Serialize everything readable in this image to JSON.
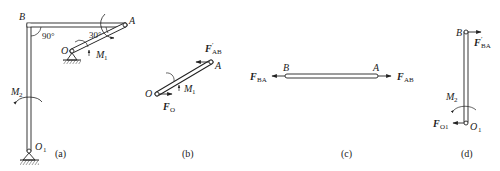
{
  "figure": {
    "panels": [
      {
        "id": "a",
        "caption": "(a)",
        "labels": {
          "B": "B",
          "A": "A",
          "O": "O",
          "O1": "O",
          "O1_sub": "1",
          "angle_90": "90°",
          "angle_30": "30°",
          "M1": "M",
          "M1_sub": "1",
          "M2": "M",
          "M2_sub": "2"
        }
      },
      {
        "id": "b",
        "caption": "(b)",
        "labels": {
          "O": "O",
          "A": "A",
          "FAB_prime": "F",
          "FAB_prime_sup": "′",
          "FAB_prime_sub": "AB",
          "M1": "M",
          "M1_sub": "1",
          "FO": "F",
          "FO_sub": "O"
        }
      },
      {
        "id": "c",
        "caption": "(c)",
        "labels": {
          "B": "B",
          "A": "A",
          "FBA": "F",
          "FBA_sub": "BA",
          "FAB": "F",
          "FAB_sub": "AB"
        }
      },
      {
        "id": "d",
        "caption": "(d)",
        "labels": {
          "B": "B",
          "O1": "O",
          "O1_sub": "1",
          "FBA_prime": "F",
          "FBA_prime_sup": "′",
          "FBA_prime_sub": "BA",
          "M2": "M",
          "M2_sub": "2",
          "FO1": "F",
          "FO1_sub": "O1"
        }
      }
    ],
    "colors": {
      "line": "#222222",
      "background": "#ffffff"
    }
  }
}
